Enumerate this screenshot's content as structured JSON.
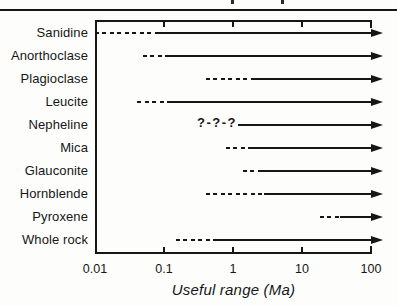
{
  "figure": {
    "kind": "book-figure",
    "background": "#fdfdfc",
    "ink_color": "#161616",
    "legend_note": "dashed = marginal/uncertain usefulness, solid arrow = useful range extending beyond 100 Ma, ?-?-? = questionable"
  },
  "chart_data": {
    "type": "range",
    "title": "",
    "xlabel": "Useful range (Ma)",
    "x_scale": "log",
    "xlim": [
      0.01,
      100
    ],
    "x_ticks": [
      0.01,
      0.1,
      1,
      10,
      100
    ],
    "x_tick_labels": [
      "0.01",
      "0.1",
      "1",
      "10",
      "100"
    ],
    "grid": false,
    "open_ended_right": true,
    "rows": [
      {
        "label": "Sanidine",
        "uncertain_style": "dashed",
        "uncertain_start": 0.01,
        "uncertain_end": 0.08,
        "solid_start": 0.08,
        "solid_end_beyond": 100
      },
      {
        "label": "Anorthoclase",
        "uncertain_style": "dashed",
        "uncertain_start": 0.05,
        "uncertain_end": 0.12,
        "solid_start": 0.12,
        "solid_end_beyond": 100
      },
      {
        "label": "Plagioclase",
        "uncertain_style": "dashed",
        "uncertain_start": 0.4,
        "uncertain_end": 2.1,
        "solid_start": 2.1,
        "solid_end_beyond": 100
      },
      {
        "label": "Leucite",
        "uncertain_style": "dashed",
        "uncertain_start": 0.04,
        "uncertain_end": 0.12,
        "solid_start": 0.12,
        "solid_end_beyond": 100
      },
      {
        "label": "Nepheline",
        "uncertain_style": "query",
        "query_text": "?-?-?",
        "uncertain_start": 0.3,
        "uncertain_end": 1.15,
        "solid_start": 1.2,
        "solid_end_beyond": 100
      },
      {
        "label": "Mica",
        "uncertain_style": "dashed",
        "uncertain_start": 0.8,
        "uncertain_end": 1.7,
        "solid_start": 1.7,
        "solid_end_beyond": 100
      },
      {
        "label": "Glauconite",
        "uncertain_style": "dashed",
        "uncertain_start": 1.4,
        "uncertain_end": 2.4,
        "solid_start": 2.4,
        "solid_end_beyond": 100
      },
      {
        "label": "Hornblende",
        "uncertain_style": "dashed",
        "uncertain_start": 0.4,
        "uncertain_end": 2.8,
        "solid_start": 2.8,
        "solid_end_beyond": 100
      },
      {
        "label": "Pyroxene",
        "uncertain_style": "dashed",
        "uncertain_start": 18,
        "uncertain_end": 35,
        "solid_start": 35,
        "solid_end_beyond": 100
      },
      {
        "label": "Whole rock",
        "uncertain_style": "dashed",
        "uncertain_start": 0.15,
        "uncertain_end": 0.55,
        "solid_start": 0.55,
        "solid_end_beyond": 100
      }
    ]
  }
}
